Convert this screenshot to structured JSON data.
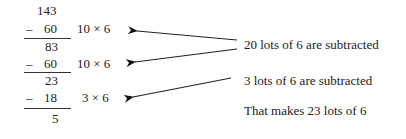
{
  "division": {
    "rows": [
      {
        "value": "143",
        "sign": "",
        "note": ""
      },
      {
        "value": "60",
        "sign": "–",
        "note": "10 × 6"
      },
      {
        "value": "83",
        "sign": "",
        "note": ""
      },
      {
        "value": "60",
        "sign": "–",
        "note": "10 × 6"
      },
      {
        "value": "23",
        "sign": "",
        "note": ""
      },
      {
        "value": "18",
        "sign": "–",
        "note": "3 × 6"
      },
      {
        "value": "5",
        "sign": "",
        "note": ""
      }
    ]
  },
  "annotations": {
    "first": "20 lots of 6 are subtracted",
    "second": "3 lots of 6 are subtracted",
    "conclusion": "That makes 23 lots of 6"
  }
}
